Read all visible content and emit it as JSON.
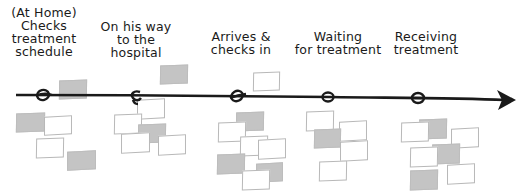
{
  "diagram": {
    "type": "customer-journey-timeline",
    "line_color": "#1a1a1a",
    "note_colors": {
      "blank_fill": "#ffffff",
      "blank_border": "#b8b8b8",
      "filled_fill": "#c4c4c4"
    },
    "stages": [
      {
        "id": "at-home",
        "label": "(At Home)\nChecks\ntreatment\nschedule",
        "node_x": 42
      },
      {
        "id": "on-way",
        "label": "On his way\nto the\nhospital",
        "node_x": 134
      },
      {
        "id": "arrives",
        "label": "Arrives &\nchecks in",
        "node_x": 238
      },
      {
        "id": "waiting",
        "label": "Waiting\nfor treatment",
        "node_x": 328
      },
      {
        "id": "receiving",
        "label": "Receiving\ntreatment",
        "node_x": 418
      }
    ],
    "notes": [
      {
        "stage": "at-home",
        "type": "filled",
        "x": 59,
        "y": 80,
        "w": 28,
        "h": 19,
        "rot": -2
      },
      {
        "stage": "at-home",
        "type": "filled",
        "x": 16,
        "y": 113,
        "w": 29,
        "h": 19,
        "rot": -2
      },
      {
        "stage": "at-home",
        "type": "blank",
        "x": 44,
        "y": 116,
        "w": 28,
        "h": 19,
        "rot": -3
      },
      {
        "stage": "at-home",
        "type": "blank",
        "x": 36,
        "y": 138,
        "w": 28,
        "h": 20,
        "rot": -2
      },
      {
        "stage": "at-home",
        "type": "filled",
        "x": 67,
        "y": 151,
        "w": 29,
        "h": 19,
        "rot": -3
      },
      {
        "stage": "on-way",
        "type": "filled",
        "x": 160,
        "y": 65,
        "w": 28,
        "h": 19,
        "rot": -2
      },
      {
        "stage": "on-way",
        "type": "blank",
        "x": 137,
        "y": 99,
        "w": 28,
        "h": 20,
        "rot": -3
      },
      {
        "stage": "on-way",
        "type": "blank",
        "x": 114,
        "y": 114,
        "w": 28,
        "h": 20,
        "rot": -2
      },
      {
        "stage": "on-way",
        "type": "filled",
        "x": 138,
        "y": 124,
        "w": 28,
        "h": 19,
        "rot": -2
      },
      {
        "stage": "on-way",
        "type": "blank",
        "x": 121,
        "y": 133,
        "w": 29,
        "h": 20,
        "rot": -3
      },
      {
        "stage": "on-way",
        "type": "blank",
        "x": 158,
        "y": 135,
        "w": 28,
        "h": 20,
        "rot": -3
      },
      {
        "stage": "arrives",
        "type": "blank",
        "x": 253,
        "y": 72,
        "w": 27,
        "h": 19,
        "rot": -2
      },
      {
        "stage": "arrives",
        "type": "filled",
        "x": 236,
        "y": 112,
        "w": 28,
        "h": 19,
        "rot": -2
      },
      {
        "stage": "arrives",
        "type": "blank",
        "x": 218,
        "y": 122,
        "w": 28,
        "h": 20,
        "rot": -2
      },
      {
        "stage": "arrives",
        "type": "blank",
        "x": 240,
        "y": 136,
        "w": 28,
        "h": 20,
        "rot": -2
      },
      {
        "stage": "arrives",
        "type": "blank",
        "x": 258,
        "y": 139,
        "w": 28,
        "h": 20,
        "rot": -3
      },
      {
        "stage": "arrives",
        "type": "filled",
        "x": 217,
        "y": 154,
        "w": 28,
        "h": 20,
        "rot": -2
      },
      {
        "stage": "arrives",
        "type": "filled",
        "x": 256,
        "y": 163,
        "w": 27,
        "h": 19,
        "rot": -3
      },
      {
        "stage": "arrives",
        "type": "blank",
        "x": 242,
        "y": 170,
        "w": 28,
        "h": 20,
        "rot": -2
      },
      {
        "stage": "waiting",
        "type": "blank",
        "x": 306,
        "y": 111,
        "w": 28,
        "h": 20,
        "rot": -2
      },
      {
        "stage": "waiting",
        "type": "blank",
        "x": 339,
        "y": 121,
        "w": 28,
        "h": 20,
        "rot": -3
      },
      {
        "stage": "waiting",
        "type": "filled",
        "x": 314,
        "y": 129,
        "w": 27,
        "h": 19,
        "rot": -2
      },
      {
        "stage": "waiting",
        "type": "blank",
        "x": 340,
        "y": 141,
        "w": 28,
        "h": 20,
        "rot": -3
      },
      {
        "stage": "waiting",
        "type": "blank",
        "x": 319,
        "y": 161,
        "w": 28,
        "h": 20,
        "rot": -2
      },
      {
        "stage": "receiving",
        "type": "filled",
        "x": 419,
        "y": 119,
        "w": 28,
        "h": 20,
        "rot": -2
      },
      {
        "stage": "receiving",
        "type": "blank",
        "x": 401,
        "y": 122,
        "w": 28,
        "h": 20,
        "rot": -2
      },
      {
        "stage": "receiving",
        "type": "blank",
        "x": 451,
        "y": 128,
        "w": 28,
        "h": 20,
        "rot": -3
      },
      {
        "stage": "receiving",
        "type": "filled",
        "x": 432,
        "y": 144,
        "w": 28,
        "h": 20,
        "rot": -2
      },
      {
        "stage": "receiving",
        "type": "blank",
        "x": 410,
        "y": 147,
        "w": 28,
        "h": 20,
        "rot": -2
      },
      {
        "stage": "receiving",
        "type": "blank",
        "x": 447,
        "y": 164,
        "w": 28,
        "h": 20,
        "rot": -3
      },
      {
        "stage": "receiving",
        "type": "filled",
        "x": 410,
        "y": 170,
        "w": 28,
        "h": 20,
        "rot": -2
      }
    ]
  }
}
